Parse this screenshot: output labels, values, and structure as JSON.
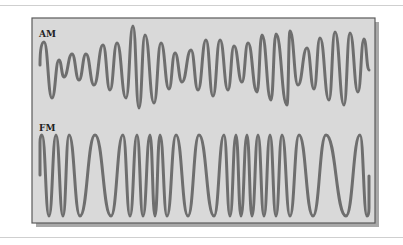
{
  "figure": {
    "colors": {
      "frame_fill": "#d9d9d9",
      "frame_border": "#5a5a5a",
      "shadow": "#a8a8a8",
      "waveform_stroke": "#6e6e6e",
      "rule": "#cfcfcf"
    },
    "panels": [
      {
        "id": "am",
        "label": "AM",
        "type": "amplitude-modulated sine wave",
        "points": [
          [
            40,
            65
          ],
          [
            44,
            42
          ],
          [
            52,
            98
          ],
          [
            59,
            60
          ],
          [
            64,
            77
          ],
          [
            72,
            54
          ],
          [
            79,
            80
          ],
          [
            86,
            54
          ],
          [
            94,
            85
          ],
          [
            103,
            45
          ],
          [
            110,
            90
          ],
          [
            117,
            43
          ],
          [
            126,
            98
          ],
          [
            133,
            26
          ],
          [
            139,
            108
          ],
          [
            145,
            35
          ],
          [
            154,
            103
          ],
          [
            161,
            43
          ],
          [
            169,
            89
          ],
          [
            175,
            53
          ],
          [
            182,
            82
          ],
          [
            191,
            50
          ],
          [
            198,
            90
          ],
          [
            206,
            40
          ],
          [
            213,
            96
          ],
          [
            220,
            40
          ],
          [
            228,
            90
          ],
          [
            234,
            46
          ],
          [
            242,
            82
          ],
          [
            248,
            43
          ],
          [
            257,
            92
          ],
          [
            262,
            35
          ],
          [
            271,
            100
          ],
          [
            276,
            34
          ],
          [
            287,
            105
          ],
          [
            290,
            31
          ],
          [
            298,
            85
          ],
          [
            307,
            48
          ],
          [
            314,
            89
          ],
          [
            320,
            38
          ],
          [
            329,
            100
          ],
          [
            335,
            32
          ],
          [
            344,
            105
          ],
          [
            350,
            33
          ],
          [
            358,
            92
          ],
          [
            364,
            39
          ],
          [
            369,
            70
          ]
        ]
      },
      {
        "id": "fm",
        "label": "FM",
        "type": "frequency-modulated sine wave",
        "top_y": 135,
        "bottom_y": 216,
        "start": [
          40,
          175
        ],
        "extrema_x": [
          42,
          49,
          56,
          63,
          69,
          80,
          95,
          111,
          123,
          130,
          137,
          143,
          150,
          155,
          160,
          167,
          176,
          188,
          199,
          214,
          224,
          230,
          236,
          241,
          247,
          252,
          258,
          264,
          270,
          276,
          282,
          290,
          299,
          313,
          326,
          346,
          360,
          367
        ],
        "end": [
          369,
          176
        ]
      }
    ]
  }
}
